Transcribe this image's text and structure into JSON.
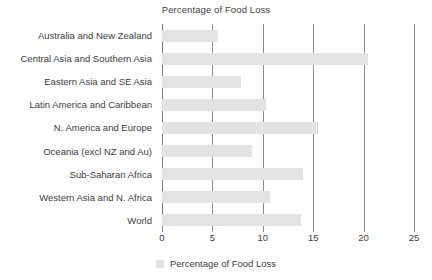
{
  "chart_data": {
    "type": "bar",
    "orientation": "horizontal",
    "title": "Percentage of Food Loss",
    "xlabel": "",
    "ylabel": "",
    "xlim": [
      0,
      25
    ],
    "xticks": [
      0,
      5,
      10,
      15,
      20,
      25
    ],
    "grid": true,
    "legend_position": "bottom",
    "series": [
      {
        "name": "Percentage of Food Loss",
        "color": "#e3e3e3",
        "values": [
          5.6,
          20.4,
          7.8,
          10.3,
          15.5,
          8.9,
          14.0,
          10.7,
          13.8
        ]
      }
    ],
    "categories": [
      "Australia and New Zealand",
      "Central Asia and Southern Asia",
      "Eastern Asia and SE Asia",
      "Latin America and Caribbean",
      "N. America and Europe",
      "Oceania (excl NZ and Au)",
      "Sub-Saharan Africa",
      "Western Asia and N. Africa",
      "World"
    ]
  },
  "legend": {
    "label": "Percentage of Food Loss"
  },
  "colors": {
    "bar": "#e3e3e3",
    "gridline": "#8a8a8a",
    "text": "#3c3c3c"
  }
}
